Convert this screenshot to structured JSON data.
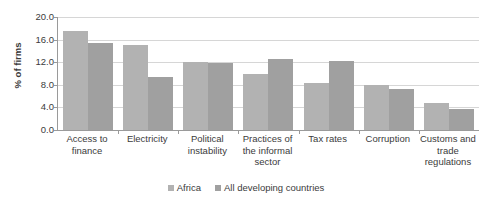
{
  "chart_data": {
    "type": "bar",
    "title": "",
    "xlabel": "",
    "ylabel": "% of firms",
    "ylim": [
      0.0,
      20.0
    ],
    "ytick_step": 4.0,
    "ytick_labels": [
      "20.0",
      "16.0",
      "12.0",
      "8.0",
      "4.0",
      "0.0"
    ],
    "ytick_values": [
      20.0,
      16.0,
      12.0,
      8.0,
      4.0,
      0.0
    ],
    "grid": true,
    "legend_position": "bottom",
    "categories": [
      "Access to finance",
      "Electricity",
      "Political instability",
      "Practices of the informal sector",
      "Tax rates",
      "Corruption",
      "Customs and trade regulations"
    ],
    "category_lines": [
      [
        "Access to",
        "finance"
      ],
      [
        "Electricity"
      ],
      [
        "Political",
        "instability"
      ],
      [
        "Practices of",
        "the informal",
        "sector"
      ],
      [
        "Tax rates"
      ],
      [
        "Corruption"
      ],
      [
        "Customs and",
        "trade",
        "regulations"
      ]
    ],
    "series": [
      {
        "name": "Africa",
        "color": "#b2b2b2",
        "values": [
          17.5,
          15.1,
          12.0,
          10.0,
          8.3,
          8.0,
          4.8
        ]
      },
      {
        "name": "All developing countries",
        "color": "#a0a0a0",
        "values": [
          15.4,
          9.4,
          11.9,
          12.5,
          12.3,
          7.3,
          3.7
        ]
      }
    ]
  },
  "legend": {
    "items": [
      {
        "label": "Africa"
      },
      {
        "label": "All developing countries"
      }
    ]
  }
}
